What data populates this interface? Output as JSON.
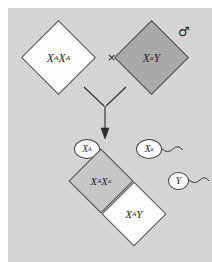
{
  "figure": {
    "background_color": "#d4d4d4",
    "cross_symbol": "×",
    "sex_symbols": {
      "female": "♀",
      "male": "♂"
    }
  },
  "parents": {
    "mother": {
      "sex_symbol": "♀",
      "genotype_base": "X",
      "genotype_sup1": "A",
      "genotype_base2": "X",
      "genotype_sup2": "A",
      "genotype_plain": "XAXA",
      "fill_color": "#fdfdfd",
      "phenotype": "unaffected"
    },
    "father": {
      "sex_symbol": "♂",
      "genotype_base": "X",
      "genotype_sup1": "a",
      "genotype_base2": "Y",
      "genotype_plain": "XaY",
      "fill_color": "#a9a9a9",
      "phenotype": "affected"
    }
  },
  "gametes": [
    {
      "id": "egg-xa",
      "base": "X",
      "sup": "A",
      "label_plain": "XA",
      "source": "mother",
      "has_tail": false
    },
    {
      "id": "sperm-xa",
      "base": "X",
      "sup": "a",
      "label_plain": "Xa",
      "source": "father",
      "has_tail": true
    },
    {
      "id": "sperm-y",
      "base": "Y",
      "sup": "",
      "label_plain": "Y",
      "source": "father",
      "has_tail": true
    }
  ],
  "offspring": {
    "daughter": {
      "genotype_base": "X",
      "genotype_sup1": "A",
      "genotype_base2": "X",
      "genotype_sup2": "a",
      "genotype_plain": "XAXa",
      "fill_color": "#c6c6c6",
      "phenotype": "carrier"
    },
    "son": {
      "genotype_base": "X",
      "genotype_sup1": "A",
      "genotype_base2": "Y",
      "genotype_plain": "XAY",
      "fill_color": "#fdfdfd",
      "phenotype": "unaffected"
    }
  }
}
